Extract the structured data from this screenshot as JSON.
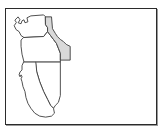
{
  "panel": {
    "title": "Western United States outline map",
    "background_color": "#ffffff",
    "border_color": "#2b2b2b",
    "shadow_color": "#9a9a9a"
  },
  "map": {
    "region_label": "Pacific Northwest and West",
    "projection_note": "simple outline",
    "outline_color": "#3a3a3a",
    "default_fill": "#ffffff",
    "highlight_fill": "#d9d9d9",
    "states": [
      {
        "id": "washington",
        "name": "Washington",
        "abbr": "WA",
        "highlighted": false,
        "fill": "#ffffff",
        "path": "M 57 23 L 60 20 L 62 23 L 60 26 L 63 27 L 64 24 L 66 23 L 67 26 L 70 25 L 69 21 L 73 19 L 86 18 L 88 20 L 88 28 L 90 31 L 90 35 L 86 40 L 66 41 L 63 39 L 61 35 L 58 33 L 56 29 L 58 26 Z"
      },
      {
        "id": "oregon",
        "name": "Oregon",
        "abbr": "OR",
        "highlighted": false,
        "fill": "#ffffff",
        "path": "M 66 41 L 86 40 L 90 35 L 93 39 L 96 43 L 99 47 L 101 52 L 103 57 L 103 66 L 78 66 L 66 66 L 64 58 L 63 50 L 63 44 Z"
      },
      {
        "id": "idaho",
        "name": "Idaho",
        "abbr": "ID",
        "highlighted": true,
        "fill": "#d9d9d9",
        "path": "M 88 20 L 94 20 L 95 32 L 98 37 L 100 40 L 103 43 L 106 45 L 109 48 L 113 50 L 113 64 L 103 64 L 103 57 L 101 52 L 99 47 L 96 43 L 93 39 L 90 35 L 90 31 L 88 28 Z"
      },
      {
        "id": "nevada",
        "name": "Nevada",
        "abbr": "NV",
        "highlighted": false,
        "fill": "#ffffff",
        "path": "M 78 66 L 103 66 L 103 100 L 101 107 L 98 110 L 96 113 L 93 110 L 90 104 L 86 96 L 82 86 L 79 76 Z"
      },
      {
        "id": "california",
        "name": "California",
        "abbr": "CA",
        "highlighted": false,
        "fill": "#ffffff",
        "path": "M 66 66 L 78 66 L 79 76 L 82 86 L 86 96 L 90 104 L 93 110 L 96 113 L 97 118 L 94 121 L 88 122 L 82 121 L 77 118 L 73 113 L 70 108 L 68 102 L 67 96 L 65 91 L 64 86 L 63 83 L 64 81 L 63 79 L 62 81 L 61 79 L 62 76 L 64 74 L 64 70 Z"
      }
    ]
  }
}
